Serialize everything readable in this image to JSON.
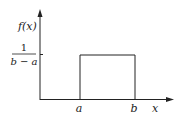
{
  "diagram": {
    "title": "",
    "y_axis_label": "f(x)",
    "x_axis_label": "x",
    "height_label": {
      "numerator": "1",
      "denominator": "b − a"
    },
    "x_ticks": [
      {
        "label": "a"
      },
      {
        "label": "b"
      }
    ],
    "shape": "rectangle",
    "colors": {
      "line": "#222222",
      "background": "#ffffff"
    }
  }
}
